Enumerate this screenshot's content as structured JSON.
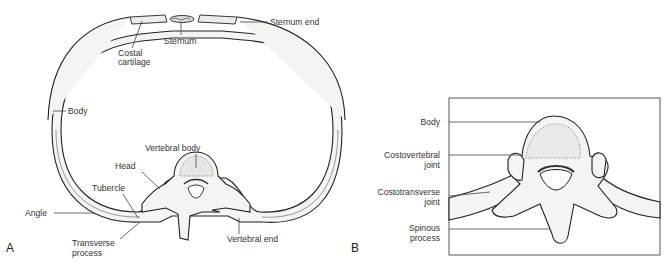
{
  "figure": {
    "panel_a": {
      "letter": "A",
      "labels": {
        "sternum_end": "Sternum end",
        "sternum": "Sternum",
        "costal_cartilage_1": "Costal",
        "costal_cartilage_2": "cartilage",
        "body": "Body",
        "vertebral_body": "Vertebral body",
        "head": "Head",
        "tubercle": "Tubercle",
        "angle": "Angle",
        "transverse_process_1": "Transverse",
        "transverse_process_2": "process",
        "vertebral_end": "Vertebral end"
      }
    },
    "panel_b": {
      "letter": "B",
      "labels": {
        "body": "Body",
        "costovertebral_1": "Costovertebral",
        "costovertebral_2": "joint",
        "costotransverse_1": "Costotransverse",
        "costotransverse_2": "joint",
        "spinous_1": "Spinous",
        "spinous_2": "process"
      }
    },
    "colors": {
      "line": "#222222",
      "bone_fill": "#f4f4f2",
      "text": "#333333"
    }
  }
}
